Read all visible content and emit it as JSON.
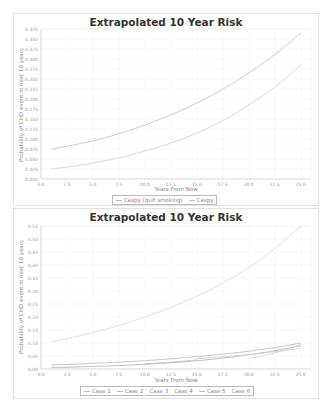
{
  "chart_data": [
    {
      "type": "line",
      "title": "Extrapolated 10 Year Risk",
      "xlabel": "Years From Now",
      "ylabel": "Probability of CHD event in next 10 years",
      "xlim": [
        0,
        26
      ],
      "ylim": [
        0,
        0.375
      ],
      "xticks": [
        "0.0",
        "2.5",
        "5.0",
        "7.5",
        "10.0",
        "12.5",
        "15.0",
        "17.5",
        "20.0",
        "22.5",
        "25.0"
      ],
      "yticks": [
        "0.000",
        "0.025",
        "0.050",
        "0.075",
        "0.100",
        "0.125",
        "0.150",
        "0.175",
        "0.200",
        "0.225",
        "0.250",
        "0.275",
        "0.300",
        "0.325",
        "0.350",
        "0.375"
      ],
      "grid": true,
      "legend_position": "bottom",
      "x": [
        1,
        5,
        10,
        15,
        20,
        25
      ],
      "series": [
        {
          "name": "Caspy (quit smoking)",
          "color": "#d4d4d4",
          "values": [
            0.025,
            0.04,
            0.07,
            0.115,
            0.185,
            0.285
          ]
        },
        {
          "name": "Caspy",
          "color": "#c8c8c8",
          "values": [
            0.075,
            0.095,
            0.135,
            0.19,
            0.265,
            0.365
          ]
        }
      ]
    },
    {
      "type": "line",
      "title": "Extrapolated 10 Year Risk",
      "xlabel": "Years From Now",
      "ylabel": "Probability of CHD event in next 10 years",
      "xlim": [
        0,
        26
      ],
      "ylim": [
        0,
        0.55
      ],
      "xticks": [
        "0.0",
        "2.5",
        "5.0",
        "7.5",
        "10.0",
        "12.5",
        "15.0",
        "17.5",
        "20.0",
        "22.5",
        "25.0"
      ],
      "yticks": [
        "0.00",
        "0.05",
        "0.10",
        "0.15",
        "0.20",
        "0.25",
        "0.30",
        "0.35",
        "0.40",
        "0.45",
        "0.50",
        "0.55"
      ],
      "grid": true,
      "legend_position": "bottom",
      "x": [
        1,
        5,
        10,
        15,
        20,
        25
      ],
      "series": [
        {
          "name": "Case 1",
          "color": "#c0c0c0",
          "values": [
            0.015,
            0.022,
            0.032,
            0.048,
            0.068,
            0.1
          ]
        },
        {
          "name": "Case 2",
          "color": "#b8b8b8",
          "values": [
            0.005,
            0.01,
            0.018,
            0.032,
            0.055,
            0.09
          ]
        },
        {
          "name": "Case 3",
          "color": "#dcdcdc",
          "values": [
            0.105,
            0.14,
            0.2,
            0.28,
            0.39,
            0.55
          ]
        },
        {
          "name": "Case 4",
          "color": "#d0d0d0",
          "values": [
            null,
            null,
            null,
            0.04,
            0.055,
            0.08
          ]
        },
        {
          "name": "Case 5",
          "color": "#c4c4c4",
          "values": [
            null,
            null,
            0.02,
            0.035,
            null,
            null
          ]
        },
        {
          "name": "Case 6",
          "color": "#d8d8d8",
          "values": [
            null,
            null,
            null,
            null,
            0.04,
            0.095
          ]
        }
      ]
    }
  ],
  "top": {
    "title": "Extrapolated 10 Year Risk",
    "xlabel": "Years From Now",
    "ylabel": "Probability of CHD event in next 10 years",
    "legend": [
      "Caspy (quit smoking)",
      "Caspy"
    ]
  },
  "bottom": {
    "title": "Extrapolated 10 Year Risk",
    "xlabel": "Years From Now",
    "ylabel": "Probability of CHD event in next 10 years",
    "legend": [
      "Case 1",
      "Case 2",
      "Case 3",
      "Case 4",
      "Case 5",
      "Case 6"
    ]
  }
}
